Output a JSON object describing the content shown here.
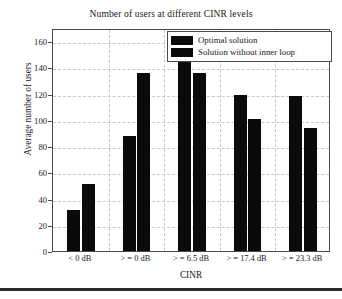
{
  "chart_data": {
    "type": "bar",
    "title": "Number of users at different CINR levels",
    "xlabel": "CINR",
    "ylabel": "Average number of users",
    "categories": [
      "< 0 dB",
      "> = 0 dB",
      "> = 6.5 dB",
      "> = 17.4 dB",
      "> = 23.3 dB"
    ],
    "series": [
      {
        "name": "Optimal solution",
        "values": [
          31,
          88,
          152,
          119,
          118
        ],
        "color": "#0a0a0a"
      },
      {
        "name": "Solution without inner loop",
        "values": [
          51,
          136,
          136,
          101,
          94
        ],
        "color": "#0a0a0a"
      }
    ],
    "ylim": [
      0,
      170
    ],
    "yticks": [
      0,
      20,
      40,
      60,
      80,
      100,
      120,
      140,
      160
    ],
    "grid": "dashed-light-both-axes",
    "legend_position": "top-right"
  },
  "legend": {
    "items": [
      {
        "label": "Optimal solution"
      },
      {
        "label": "Solution without inner loop"
      }
    ]
  }
}
